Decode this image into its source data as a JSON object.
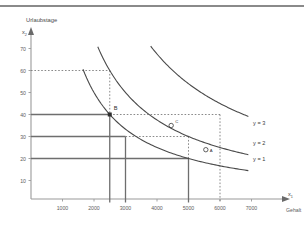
{
  "figure": {
    "background_color": "#ffffff",
    "top_band_color": "#8a8a8a"
  },
  "chart_data": {
    "type": "line",
    "title": "Urlaubstage",
    "xlabel": "Gehalt",
    "ylabel": "Urlaubstage",
    "x_axis_symbol": "x",
    "x_axis_subscript": "1",
    "y_axis_symbol": "x",
    "y_axis_subscript": "2",
    "xlim": [
      0,
      7600
    ],
    "ylim": [
      0,
      78
    ],
    "grid": false,
    "legend_position": "right-of-curves",
    "xticks": [
      1000,
      2000,
      3000,
      4000,
      5000,
      6000,
      7000
    ],
    "xticklabels": [
      "1000",
      "2000",
      "3000",
      "4000",
      "5000",
      "6000",
      "7000"
    ],
    "yticks": [
      10,
      20,
      30,
      40,
      50,
      60,
      70
    ],
    "yticklabels": [
      "10",
      "20",
      "30",
      "40",
      "50",
      "60",
      "70"
    ],
    "series": [
      {
        "name": "y = 1",
        "label": "y = 1",
        "label_x": 7050,
        "label_y": 20,
        "constant": 100000,
        "x_start": 1650,
        "x_end": 6900,
        "color": "#4a4a4a"
      },
      {
        "name": "y = 2",
        "label": "y = 2",
        "label_x": 7050,
        "label_y": 27,
        "constant": 150000,
        "x_start": 2120,
        "x_end": 6900,
        "color": "#4a4a4a"
      },
      {
        "name": "y = 3",
        "label": "y = 3",
        "label_x": 7050,
        "label_y": 36,
        "constant": 270000,
        "x_start": 3800,
        "x_end": 6900,
        "color": "#4a4a4a"
      }
    ],
    "points": [
      {
        "name": "B",
        "label": "B",
        "x": 2500,
        "y": 40,
        "marker": "filled-square",
        "label_offset_x": 4,
        "label_offset_y": -5
      },
      {
        "name": "C",
        "label": "C",
        "x": 4450,
        "y": 35,
        "marker": "open-circle",
        "label_offset_x": 4,
        "label_offset_y": -3
      },
      {
        "name": "A",
        "label": "A",
        "x": 5550,
        "y": 24,
        "marker": "open-circle",
        "label_offset_x": 4,
        "label_offset_y": 2
      }
    ],
    "solid_guides": [
      {
        "name": "h-40-to-B",
        "orientation": "horizontal",
        "y": 40,
        "x_from": 0,
        "x_to": 2500
      },
      {
        "name": "h-30-to-3000",
        "orientation": "horizontal",
        "y": 30,
        "x_from": 0,
        "x_to": 3000
      },
      {
        "name": "h-20-to-5000",
        "orientation": "horizontal",
        "y": 20,
        "x_from": 0,
        "x_to": 5000
      },
      {
        "name": "v-2500-down",
        "orientation": "vertical",
        "x": 2500,
        "y_from": 40,
        "y_to": 0
      },
      {
        "name": "v-3000-down",
        "orientation": "vertical",
        "x": 3000,
        "y_from": 30,
        "y_to": 0
      },
      {
        "name": "v-5000-down",
        "orientation": "vertical",
        "x": 5000,
        "y_from": 20,
        "y_to": 0
      }
    ],
    "dotted_guides": [
      {
        "name": "h-60-to-2500",
        "orientation": "horizontal",
        "y": 60,
        "x_from": 0,
        "x_to": 2500
      },
      {
        "name": "v-2500-60-to-40",
        "orientation": "vertical",
        "x": 2500,
        "y_from": 60,
        "y_to": 40
      },
      {
        "name": "h-40-2500-to-6000",
        "orientation": "horizontal",
        "y": 40,
        "x_from": 2500,
        "x_to": 6000
      },
      {
        "name": "v-6000-40-down",
        "orientation": "vertical",
        "x": 6000,
        "y_from": 40,
        "y_to": 0
      },
      {
        "name": "h-30-3000-to-5000",
        "orientation": "horizontal",
        "y": 30,
        "x_from": 3000,
        "x_to": 5000
      },
      {
        "name": "v-5000-30-down",
        "orientation": "vertical",
        "x": 5000,
        "y_from": 30,
        "y_to": 20
      }
    ]
  }
}
